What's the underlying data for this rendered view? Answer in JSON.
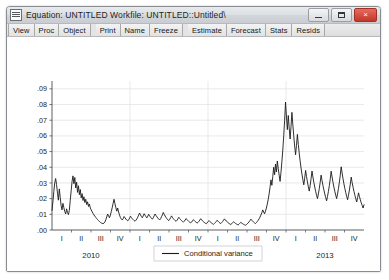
{
  "window": {
    "title": "Equation: UNTITLED   Workfile: UNTITLED::Untitled\\",
    "sysmenu_icon": "system-menu-icon",
    "buttons": {
      "minimize": "minimize-button",
      "maximize": "maximize-button",
      "close_label": "×"
    }
  },
  "toolbar": {
    "groups": [
      [
        "View",
        "Proc",
        "Object"
      ],
      [
        "Print",
        "Name",
        "Freeze"
      ],
      [
        "Estimate",
        "Forecast",
        "Stats",
        "Resids"
      ]
    ]
  },
  "chart_data": {
    "type": "line",
    "title": "",
    "xlabel": "",
    "ylabel": "",
    "ylim": [
      0.0,
      0.095
    ],
    "grid": true,
    "legend_position": "bottom-center",
    "y_ticks": [
      ".00",
      ".01",
      ".02",
      ".03",
      ".04",
      ".05",
      ".06",
      ".07",
      ".08",
      ".09"
    ],
    "y_tick_values": [
      0.0,
      0.01,
      0.02,
      0.03,
      0.04,
      0.05,
      0.06,
      0.07,
      0.08,
      0.09
    ],
    "quarter_labels": [
      "I",
      "II",
      "III",
      "IV",
      "I",
      "II",
      "III",
      "IV",
      "I",
      "II",
      "III",
      "IV",
      "I",
      "II",
      "III",
      "IV"
    ],
    "year_labels": [
      "2010",
      "2011",
      "2012",
      "2013"
    ],
    "series": [
      {
        "name": "Conditional variance",
        "color": "#1a1a1a",
        "values": [
          0.0125,
          0.018,
          0.0245,
          0.03,
          0.0328,
          0.029,
          0.0235,
          0.019,
          0.0262,
          0.0208,
          0.0155,
          0.0128,
          0.017,
          0.0142,
          0.0118,
          0.0102,
          0.0135,
          0.0112,
          0.0098,
          0.0125,
          0.019,
          0.025,
          0.031,
          0.0345,
          0.0295,
          0.0335,
          0.0268,
          0.0305,
          0.024,
          0.0282,
          0.0225,
          0.0258,
          0.0205,
          0.0232,
          0.0188,
          0.0212,
          0.0175,
          0.0196,
          0.0162,
          0.018,
          0.015,
          0.0166,
          0.014,
          0.0128,
          0.0116,
          0.0106,
          0.0096,
          0.0088,
          0.008,
          0.0073,
          0.0066,
          0.006,
          0.0054,
          0.0049,
          0.0045,
          0.0042,
          0.004,
          0.0044,
          0.0052,
          0.0065,
          0.0084,
          0.0102,
          0.009,
          0.0078,
          0.0095,
          0.0118,
          0.0142,
          0.017,
          0.0196,
          0.0168,
          0.0142,
          0.012,
          0.014,
          0.0115,
          0.0095,
          0.008,
          0.007,
          0.0064,
          0.0072,
          0.0086,
          0.0078,
          0.007,
          0.0063,
          0.0058,
          0.0065,
          0.0075,
          0.0088,
          0.008,
          0.0072,
          0.0066,
          0.006,
          0.0056,
          0.0062,
          0.0071,
          0.0082,
          0.0095,
          0.0108,
          0.0096,
          0.0086,
          0.0078,
          0.009,
          0.0104,
          0.0094,
          0.0085,
          0.0077,
          0.0088,
          0.01,
          0.009,
          0.0082,
          0.0075,
          0.0069,
          0.0078,
          0.009,
          0.0102,
          0.0092,
          0.0084,
          0.0076,
          0.007,
          0.0064,
          0.0072,
          0.0084,
          0.0096,
          0.0112,
          0.01,
          0.0089,
          0.008,
          0.0072,
          0.0065,
          0.006,
          0.0068,
          0.0078,
          0.009,
          0.0081,
          0.0073,
          0.0066,
          0.006,
          0.0055,
          0.0062,
          0.0071,
          0.0081,
          0.0073,
          0.0066,
          0.006,
          0.0055,
          0.005,
          0.0056,
          0.0064,
          0.0073,
          0.0066,
          0.006,
          0.0054,
          0.0049,
          0.0045,
          0.0051,
          0.0058,
          0.0066,
          0.006,
          0.0054,
          0.0049,
          0.0044,
          0.0048,
          0.0055,
          0.0063,
          0.0072,
          0.0065,
          0.0058,
          0.0053,
          0.0048,
          0.0044,
          0.004,
          0.0045,
          0.0052,
          0.006,
          0.0054,
          0.0049,
          0.0044,
          0.004,
          0.0036,
          0.0041,
          0.0047,
          0.0054,
          0.0062,
          0.0056,
          0.005,
          0.0045,
          0.0041,
          0.0047,
          0.0054,
          0.0062,
          0.0071,
          0.0064,
          0.0057,
          0.0052,
          0.0047,
          0.0042,
          0.0038,
          0.0035,
          0.004,
          0.0046,
          0.0053,
          0.0048,
          0.0043,
          0.0039,
          0.0035,
          0.0032,
          0.0037,
          0.0043,
          0.0049,
          0.0044,
          0.004,
          0.0036,
          0.0033,
          0.003,
          0.0034,
          0.0039,
          0.0045,
          0.0052,
          0.006,
          0.0069,
          0.0062,
          0.0056,
          0.005,
          0.0045,
          0.0041,
          0.0047,
          0.0054,
          0.0062,
          0.0071,
          0.0082,
          0.0095,
          0.011,
          0.0128,
          0.0115,
          0.0103,
          0.012,
          0.014,
          0.0165,
          0.0195,
          0.023,
          0.0272,
          0.032,
          0.0285,
          0.034,
          0.04,
          0.0352,
          0.042,
          0.037,
          0.044,
          0.039,
          0.035,
          0.031,
          0.0368,
          0.0435,
          0.051,
          0.06,
          0.07,
          0.0815,
          0.072,
          0.064,
          0.073,
          0.065,
          0.058,
          0.066,
          0.075,
          0.067,
          0.06,
          0.0535,
          0.048,
          0.054,
          0.061,
          0.0545,
          0.049,
          0.044,
          0.0395,
          0.0355,
          0.032,
          0.0288,
          0.033,
          0.038,
          0.034,
          0.0306,
          0.0275,
          0.0248,
          0.0285,
          0.0328,
          0.0376,
          0.0338,
          0.0304,
          0.0274,
          0.0247,
          0.0222,
          0.02,
          0.023,
          0.0265,
          0.0305,
          0.035,
          0.0315,
          0.0284,
          0.0256,
          0.023,
          0.0207,
          0.0186,
          0.0214,
          0.0246,
          0.0283,
          0.0326,
          0.0375,
          0.0338,
          0.0304,
          0.0274,
          0.0247,
          0.0222,
          0.02,
          0.023,
          0.0265,
          0.0305,
          0.035,
          0.0403,
          0.0363,
          0.0327,
          0.0294,
          0.0265,
          0.0238,
          0.0214,
          0.0193,
          0.0222,
          0.0255,
          0.0293,
          0.0337,
          0.0303,
          0.0273,
          0.0246,
          0.0221,
          0.0199,
          0.0179,
          0.0206,
          0.0237,
          0.0213,
          0.0192,
          0.0173,
          0.0156,
          0.014,
          0.0161
        ]
      }
    ]
  },
  "legend": {
    "label": "Conditional variance"
  }
}
